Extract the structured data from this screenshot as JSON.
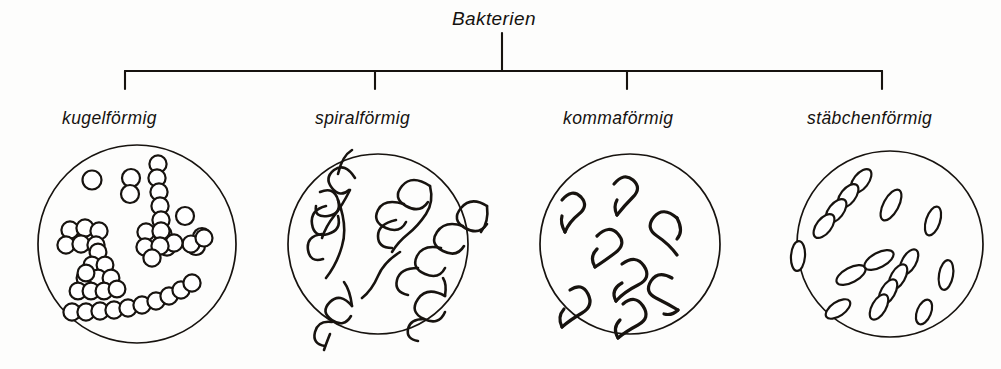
{
  "figure": {
    "title": "Bakterien",
    "language": "de",
    "background_color": "#fdfdfc",
    "ink_color": "#17130f",
    "categories": [
      {
        "label": "kugelförmig",
        "shape_name": "coccus",
        "dish": {
          "cx": 137,
          "cy": 244,
          "r": 99
        },
        "branch_x": 125,
        "label_x": 62,
        "label_y": 108
      },
      {
        "label": "spiralförmig",
        "shape_name": "spirillum",
        "dish": {
          "cx": 378,
          "cy": 244,
          "r": 90
        },
        "branch_x": 375,
        "label_x": 315,
        "label_y": 108
      },
      {
        "label": "kommaförmig",
        "shape_name": "vibrio",
        "dish": {
          "cx": 630,
          "cy": 244,
          "r": 90
        },
        "branch_x": 627,
        "label_x": 563,
        "label_y": 108
      },
      {
        "label": "stäbchenförmig",
        "shape_name": "bacillus",
        "dish": {
          "cx": 890,
          "cy": 244,
          "r": 93
        },
        "branch_x": 882,
        "label_x": 807,
        "label_y": 108
      }
    ],
    "connector": {
      "stem_x": 502,
      "stem_top_y": 33,
      "bar_y": 71,
      "bar_left_x": 125,
      "bar_right_x": 882,
      "drop_bottom_y": 88,
      "stroke_width": 2.1
    }
  }
}
